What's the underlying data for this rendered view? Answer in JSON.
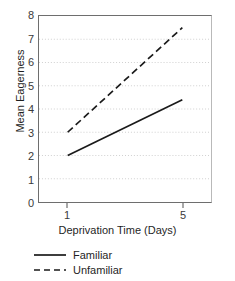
{
  "chart_data": {
    "type": "line",
    "title": "",
    "xlabel": "Deprivation Time (Days)",
    "ylabel": "Mean Eagerness",
    "x": [
      1,
      5
    ],
    "xlim": [
      0,
      6
    ],
    "ylim": [
      0,
      8
    ],
    "xticks": [
      1,
      5
    ],
    "xtick_labels": [
      "1",
      "5"
    ],
    "yticks": [
      0,
      1,
      2,
      3,
      4,
      5,
      6,
      7,
      8
    ],
    "ytick_labels": [
      "0",
      "1",
      "2",
      "3",
      "4",
      "5",
      "6",
      "7",
      "8"
    ],
    "grid": "horizontal-dotted",
    "legend_position": "below-left",
    "series": [
      {
        "name": "Familiar",
        "style": "solid",
        "color": "#1a1a1a",
        "values": [
          2.0,
          4.4
        ]
      },
      {
        "name": "Unfamiliar",
        "style": "dashed",
        "color": "#1a1a1a",
        "values": [
          3.0,
          7.5
        ]
      }
    ]
  },
  "legend": {
    "items": [
      {
        "label": "Familiar",
        "style": "solid"
      },
      {
        "label": "Unfamiliar",
        "style": "dashed"
      }
    ]
  },
  "colors": {
    "axis": "#6e6e6e",
    "grid": "#cfcfcf",
    "line": "#1a1a1a",
    "text": "#1f1f1f",
    "background": "#ffffff"
  }
}
